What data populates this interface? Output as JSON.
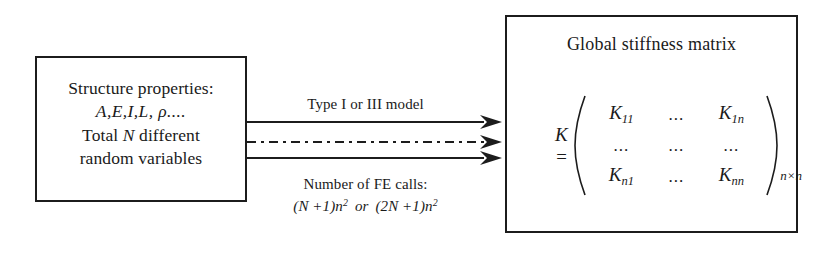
{
  "diagram": {
    "left_box": {
      "line1": "Structure properties:",
      "line2": "A,E,I,L, ρ....",
      "line3_pre": "Total ",
      "line3_var": "N",
      "line3_post": " different",
      "line4": "random variables"
    },
    "right_box": {
      "title": "Global stiffness matrix",
      "matrix": {
        "lhs": "K =",
        "rows": [
          [
            "K11",
            "...",
            "K1n"
          ],
          [
            "...",
            "...",
            "..."
          ],
          [
            "Kn1",
            "...",
            "Knn"
          ]
        ],
        "cells": {
          "r1c1_base": "K",
          "r1c1_sub": "11",
          "r1c2": "...",
          "r1c3_base": "K",
          "r1c3_sub": "1n",
          "r2c1": "...",
          "r2c2": "...",
          "r2c3": "...",
          "r3c1_base": "K",
          "r3c1_sub": "n1",
          "r3c2": "...",
          "r3c3_base": "K",
          "r3c3_sub": "nn"
        },
        "dimension_subscript": "n×n"
      }
    },
    "arrows": [
      {
        "name": "arrow-solid-top",
        "style": "solid",
        "label": "Type I or III model"
      },
      {
        "name": "arrow-dashdot-middle",
        "style": "dash-dot",
        "label": ""
      },
      {
        "name": "arrow-solid-bottom",
        "style": "solid",
        "label": ""
      }
    ],
    "labels": {
      "type_model": "Type I or III model",
      "fe_calls": "Number of FE calls:",
      "formula_left": "(N +1)n",
      "formula_left_exp": "2",
      "formula_operator": "or",
      "formula_right": "(2N +1)n",
      "formula_right_exp": "2"
    },
    "colors": {
      "stroke": "#1c1c1c",
      "background": "#ffffff",
      "text": "#1a1a1a"
    }
  }
}
